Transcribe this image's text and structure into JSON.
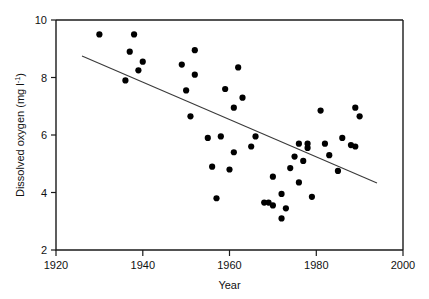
{
  "chart_data": {
    "type": "scatter",
    "title": "",
    "xlabel": "Year",
    "ylabel": "Dissolved oxygen (mg l⁻¹)",
    "ylabel_text": "Dissolved oxygen (mg l",
    "ylabel_sup": "-1",
    "ylabel_close": ")",
    "xlim": [
      1920,
      2000
    ],
    "ylim": [
      2,
      10
    ],
    "xticks": [
      1920,
      1940,
      1960,
      1980,
      2000
    ],
    "xtick_labels": [
      "1920",
      "1940",
      "1960",
      "1980",
      "2000"
    ],
    "yticks": [
      2,
      4,
      6,
      8,
      10
    ],
    "ytick_labels": [
      "2",
      "4",
      "6",
      "8",
      "10"
    ],
    "grid": false,
    "legend": "none",
    "marker": "filled-circle",
    "marker_color": "#000000",
    "points": [
      {
        "x": 1930,
        "y": 9.5
      },
      {
        "x": 1936,
        "y": 7.9
      },
      {
        "x": 1937,
        "y": 8.9
      },
      {
        "x": 1938,
        "y": 9.5
      },
      {
        "x": 1939,
        "y": 8.25
      },
      {
        "x": 1940,
        "y": 8.55
      },
      {
        "x": 1949,
        "y": 8.45
      },
      {
        "x": 1950,
        "y": 7.55
      },
      {
        "x": 1951,
        "y": 6.65
      },
      {
        "x": 1952,
        "y": 8.95
      },
      {
        "x": 1952,
        "y": 8.1
      },
      {
        "x": 1955,
        "y": 5.9
      },
      {
        "x": 1956,
        "y": 4.9
      },
      {
        "x": 1957,
        "y": 3.8
      },
      {
        "x": 1958,
        "y": 5.95
      },
      {
        "x": 1959,
        "y": 7.6
      },
      {
        "x": 1960,
        "y": 4.8
      },
      {
        "x": 1961,
        "y": 5.4
      },
      {
        "x": 1961,
        "y": 6.95
      },
      {
        "x": 1962,
        "y": 8.35
      },
      {
        "x": 1963,
        "y": 7.3
      },
      {
        "x": 1965,
        "y": 5.6
      },
      {
        "x": 1966,
        "y": 5.95
      },
      {
        "x": 1968,
        "y": 3.65
      },
      {
        "x": 1969,
        "y": 3.65
      },
      {
        "x": 1970,
        "y": 3.55
      },
      {
        "x": 1970,
        "y": 4.55
      },
      {
        "x": 1972,
        "y": 3.1
      },
      {
        "x": 1972,
        "y": 3.95
      },
      {
        "x": 1973,
        "y": 3.45
      },
      {
        "x": 1974,
        "y": 4.85
      },
      {
        "x": 1975,
        "y": 5.25
      },
      {
        "x": 1976,
        "y": 5.7
      },
      {
        "x": 1976,
        "y": 4.35
      },
      {
        "x": 1977,
        "y": 5.1
      },
      {
        "x": 1978,
        "y": 5.55
      },
      {
        "x": 1978,
        "y": 5.7
      },
      {
        "x": 1979,
        "y": 3.85
      },
      {
        "x": 1981,
        "y": 6.85
      },
      {
        "x": 1982,
        "y": 5.7
      },
      {
        "x": 1983,
        "y": 5.3
      },
      {
        "x": 1985,
        "y": 4.75
      },
      {
        "x": 1986,
        "y": 5.9
      },
      {
        "x": 1988,
        "y": 5.65
      },
      {
        "x": 1989,
        "y": 5.6
      },
      {
        "x": 1989,
        "y": 6.95
      },
      {
        "x": 1990,
        "y": 6.65
      }
    ],
    "trendline": {
      "type": "linear-regression",
      "x_start": 1926,
      "y_start": 8.75,
      "x_end": 1994,
      "y_end": 4.33
    }
  }
}
